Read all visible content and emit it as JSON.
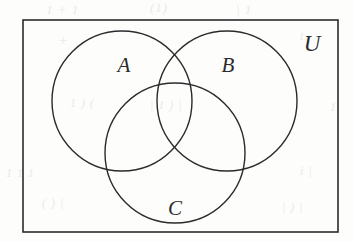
{
  "figure": {
    "type": "venn-diagram",
    "ink_color": "#2b2b2e",
    "paper_color": "#fdfdfc",
    "stroke_width": 1.4
  },
  "universe": {
    "label": "U",
    "shape": "rectangle",
    "x": 23,
    "y": 20,
    "width": 315,
    "height": 212,
    "label_x": 312,
    "label_y": 46
  },
  "sets": [
    {
      "label": "A",
      "cx": 122,
      "cy": 101,
      "r": 70,
      "label_x": 124,
      "label_y": 67
    },
    {
      "label": "B",
      "cx": 227,
      "cy": 101,
      "r": 70,
      "label_x": 228,
      "label_y": 67
    },
    {
      "label": "C",
      "cx": 175,
      "cy": 153,
      "r": 70,
      "label_x": 175,
      "label_y": 210
    }
  ],
  "bleed_through": [
    {
      "text": "1 + 1",
      "x": 46,
      "y": 2,
      "size": 13
    },
    {
      "text": "(1)",
      "x": 150,
      "y": 0,
      "size": 13
    },
    {
      "text": "| 1",
      "x": 236,
      "y": 2,
      "size": 13
    },
    {
      "text": "+",
      "x": 58,
      "y": 32,
      "size": 15
    },
    {
      "text": "t",
      "x": 300,
      "y": 28,
      "size": 13
    },
    {
      "text": "1 ) (",
      "x": 70,
      "y": 96,
      "size": 12
    },
    {
      "text": "| 1 ) |",
      "x": 150,
      "y": 98,
      "size": 12
    },
    {
      "text": "1",
      "x": 330,
      "y": 100,
      "size": 12
    },
    {
      "text": "1 1 1",
      "x": 6,
      "y": 166,
      "size": 12
    },
    {
      "text": "i |",
      "x": 300,
      "y": 164,
      "size": 12
    },
    {
      "text": "( ) |",
      "x": 42,
      "y": 196,
      "size": 12
    },
    {
      "text": "| ) |",
      "x": 282,
      "y": 200,
      "size": 12
    }
  ]
}
